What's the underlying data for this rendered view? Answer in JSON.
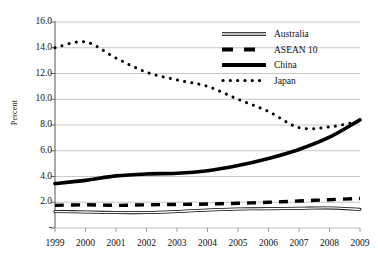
{
  "chart_data": {
    "type": "line",
    "title": "",
    "xlabel": "",
    "ylabel": "Percent",
    "x": [
      1999,
      2000,
      2001,
      2002,
      2003,
      2004,
      2005,
      2006,
      2007,
      2008,
      2009
    ],
    "xtick_labels": [
      "1999",
      "2000",
      "2001",
      "2002",
      "2003",
      "2004",
      "2005",
      "2006",
      "2007",
      "2008",
      "2009"
    ],
    "ytick_labels": [
      "16.0",
      "14.0",
      "12.0",
      "10.0",
      "8.0",
      "6.0",
      "4.0",
      "2.0",
      "-"
    ],
    "ytick_values": [
      16.0,
      14.0,
      12.0,
      10.0,
      8.0,
      6.0,
      4.0,
      2.0,
      0.0
    ],
    "ylim": [
      0.0,
      16.0
    ],
    "xlim": [
      1999,
      2009
    ],
    "grid": "horizontal",
    "legend_position": "top-right",
    "series": [
      {
        "name": "Australia",
        "style": "thin-double-line",
        "color": "#000000",
        "values": [
          1.28,
          1.24,
          1.2,
          1.2,
          1.28,
          1.4,
          1.47,
          1.5,
          1.53,
          1.56,
          1.45
        ]
      },
      {
        "name": "ASEAN 10",
        "style": "thick-dashed",
        "color": "#000000",
        "values": [
          1.76,
          1.8,
          1.76,
          1.8,
          1.83,
          1.86,
          1.92,
          2.0,
          2.1,
          2.2,
          2.3
        ]
      },
      {
        "name": "China",
        "style": "thick-solid",
        "color": "#000000",
        "values": [
          3.45,
          3.7,
          4.05,
          4.2,
          4.25,
          4.45,
          4.85,
          5.4,
          6.1,
          7.05,
          8.4
        ]
      },
      {
        "name": "Japan",
        "style": "dotted",
        "color": "#000000",
        "values": [
          14.0,
          14.45,
          13.2,
          12.1,
          11.5,
          11.0,
          10.0,
          9.05,
          7.8,
          7.85,
          8.3
        ]
      }
    ]
  },
  "legend": {
    "items": [
      {
        "label": "Australia",
        "swatch": "australia-swatch"
      },
      {
        "label": "ASEAN 10",
        "swatch": "asean-swatch"
      },
      {
        "label": "China",
        "swatch": "china-swatch"
      },
      {
        "label": "Japan",
        "swatch": "japan-swatch"
      }
    ]
  }
}
